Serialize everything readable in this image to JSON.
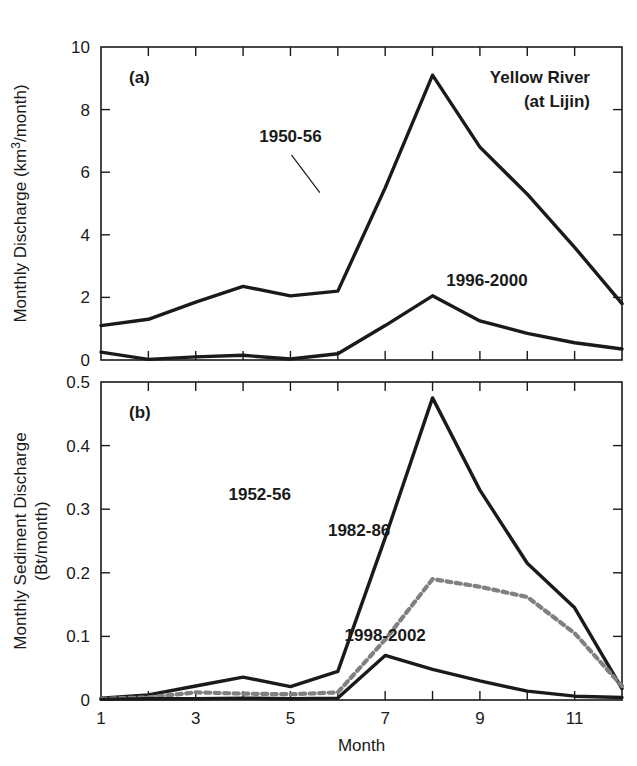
{
  "figure": {
    "title_corner": [
      "Yellow River",
      "(at Lijin)"
    ],
    "xlabel": "Month",
    "colors": {
      "solid": "#1a1a1a",
      "dotted": "#808080",
      "background": "#ffffff"
    }
  },
  "chart_data": [
    {
      "type": "line",
      "panel": "(a)",
      "title": "Yellow River (at Lijin)",
      "xlabel": "Month",
      "ylabel": "Monthly Discharge (km3/month)",
      "ylabel_line1": "Monthly Discharge (km",
      "ylabel_sup": "3",
      "ylabel_line2": "/month)",
      "xlim": [
        1,
        12
      ],
      "ylim": [
        0,
        10
      ],
      "yticks": [
        0,
        2,
        4,
        6,
        8,
        10
      ],
      "ytick_labels": [
        "0",
        "2",
        "4",
        "6",
        "8",
        "10"
      ],
      "xticks": [
        1,
        2,
        3,
        4,
        5,
        6,
        7,
        8,
        9,
        10,
        11,
        12
      ],
      "xtick_labels_shown": [
        "1",
        "3",
        "5",
        "7",
        "9",
        "11"
      ],
      "xtick_label_values": [
        1,
        3,
        5,
        7,
        9,
        11
      ],
      "grid": false,
      "legend": "inline-annotations",
      "x": [
        1,
        2,
        3,
        4,
        5,
        6,
        7,
        8,
        9,
        10,
        11,
        12
      ],
      "series": [
        {
          "name": "1950-56",
          "style": "solid",
          "color": "#1a1a1a",
          "label_x": 5.0,
          "label_y": 6.95,
          "values": [
            1.1,
            1.3,
            1.85,
            2.35,
            2.05,
            2.2,
            5.5,
            9.1,
            6.8,
            5.3,
            3.6,
            1.8
          ]
        },
        {
          "name": "1996-2000",
          "style": "solid",
          "color": "#1a1a1a",
          "label_x": 9.15,
          "label_y": 2.35,
          "values": [
            0.25,
            0.02,
            0.1,
            0.15,
            0.03,
            0.2,
            1.1,
            2.05,
            1.25,
            0.85,
            0.55,
            0.35
          ]
        }
      ]
    },
    {
      "type": "line",
      "panel": "(b)",
      "xlabel": "Month",
      "ylabel": "Monthly Sediment Discharge (Bt/month)",
      "ylabel_line1": "Monthly Sediment Discharge",
      "ylabel_line2": "(Bt/month)",
      "xlim": [
        1,
        12
      ],
      "ylim": [
        0,
        0.5
      ],
      "yticks": [
        0,
        0.1,
        0.2,
        0.3,
        0.4,
        0.5
      ],
      "ytick_labels": [
        "0",
        "0.1",
        "0.2",
        "0.3",
        "0.4",
        "0.5"
      ],
      "xticks": [
        1,
        2,
        3,
        4,
        5,
        6,
        7,
        8,
        9,
        10,
        11,
        12
      ],
      "xtick_labels_shown": [
        "1",
        "3",
        "5",
        "7",
        "9",
        "11"
      ],
      "xtick_label_values": [
        1,
        3,
        5,
        7,
        9,
        11
      ],
      "grid": false,
      "legend": "inline-annotations",
      "x": [
        1,
        2,
        3,
        4,
        5,
        6,
        7,
        8,
        9,
        10,
        11,
        12
      ],
      "series": [
        {
          "name": "1952-56",
          "style": "solid",
          "color": "#1a1a1a",
          "label_x": 4.35,
          "label_y": 0.315,
          "values": [
            0.003,
            0.008,
            0.022,
            0.036,
            0.021,
            0.045,
            0.255,
            0.475,
            0.33,
            0.215,
            0.145,
            0.018
          ]
        },
        {
          "name": "1982-86",
          "style": "dotted",
          "color": "#808080",
          "label_x": 6.45,
          "label_y": 0.258,
          "values": [
            0.002,
            0.004,
            0.012,
            0.01,
            0.009,
            0.012,
            0.095,
            0.19,
            0.178,
            0.162,
            0.105,
            0.022
          ]
        },
        {
          "name": "1998-2002",
          "style": "solid",
          "color": "#1a1a1a",
          "label_x": 7.0,
          "label_y": 0.092,
          "values": [
            0.001,
            0.002,
            0.002,
            0.003,
            0.002,
            0.003,
            0.07,
            0.048,
            0.03,
            0.014,
            0.006,
            0.004
          ]
        }
      ]
    }
  ]
}
